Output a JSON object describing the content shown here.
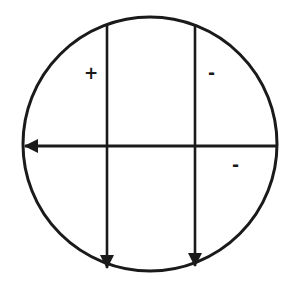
{
  "diagram": {
    "type": "circle-with-arrows",
    "stroke_color": "#1a1a1a",
    "background": "#ffffff",
    "circle": {
      "cx": 150,
      "cy": 144,
      "r": 127
    },
    "arrows": [
      {
        "id": "vertical-left",
        "direction": "down",
        "x1": 107,
        "y1": 25,
        "x2": 107,
        "y2": 269
      },
      {
        "id": "vertical-right",
        "direction": "down",
        "x1": 195,
        "y1": 25,
        "x2": 195,
        "y2": 269
      },
      {
        "id": "horizontal",
        "direction": "left",
        "x1": 277,
        "y1": 146,
        "x2": 24,
        "y2": 146
      }
    ],
    "labels": [
      {
        "id": "plus-upper-left",
        "text": "+",
        "x": 90,
        "y": 78
      },
      {
        "id": "minus-upper-right",
        "text": "-",
        "x": 214,
        "y": 78
      },
      {
        "id": "minus-lower-right",
        "text": "-",
        "x": 238,
        "y": 170
      }
    ]
  }
}
